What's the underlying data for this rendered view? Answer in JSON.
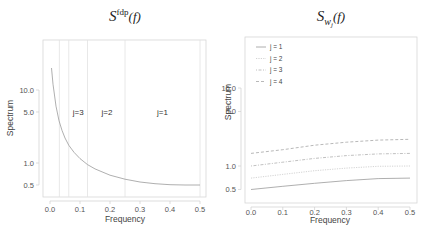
{
  "chart_data": [
    {
      "type": "line",
      "title": "S^fdp(f)",
      "title_main": "S",
      "title_sup": "fdp",
      "title_arg": "(f)",
      "xlabel": "Frequency",
      "ylabel": "Spectrum",
      "xlim": [
        0,
        0.5
      ],
      "ylim_log": [
        0.35,
        40
      ],
      "yscale": "log",
      "xticks": [
        "0.0",
        "0.1",
        "0.2",
        "0.3",
        "0.4",
        "0.5"
      ],
      "yticks": [
        "0.5",
        "1.0",
        "5.0",
        "10.0"
      ],
      "grid": false,
      "vlines": [
        0.03125,
        0.0625,
        0.125,
        0.25,
        0.5
      ],
      "annotations": [
        {
          "text": "j=3",
          "x": 0.094,
          "y": 5.0
        },
        {
          "text": "j=2",
          "x": 0.19,
          "y": 5.0
        },
        {
          "text": "j=1",
          "x": 0.375,
          "y": 5.0
        }
      ],
      "series": [
        {
          "name": "S_fdp",
          "x": [
            0.005,
            0.01,
            0.02,
            0.03,
            0.04,
            0.05,
            0.0625,
            0.08,
            0.1,
            0.125,
            0.15,
            0.2,
            0.25,
            0.3,
            0.35,
            0.4,
            0.45,
            0.5
          ],
          "values": [
            20.0,
            12.0,
            6.0,
            3.8,
            2.8,
            2.2,
            1.75,
            1.4,
            1.15,
            0.95,
            0.83,
            0.68,
            0.6,
            0.55,
            0.52,
            0.505,
            0.5,
            0.5
          ]
        }
      ]
    },
    {
      "type": "line",
      "title": "S_{w_j}(f)",
      "title_main": "S",
      "title_sub": "w",
      "title_subsub": "j",
      "title_arg": "(f)",
      "xlabel": "Frequency",
      "ylabel": "Spectrum",
      "xlim": [
        0,
        0.5
      ],
      "yscale": "log",
      "xticks": [
        "0.0",
        "0.1",
        "0.2",
        "0.3",
        "0.4",
        "0.5"
      ],
      "yticks": [
        "0.5",
        "1.0",
        "5.0",
        "10.0"
      ],
      "grid": false,
      "legend_position": "upper left",
      "legend": [
        "j = 1",
        "j = 2",
        "j = 3",
        "j = 4"
      ],
      "x": [
        0.0,
        0.1,
        0.2,
        0.3,
        0.4,
        0.5
      ],
      "series": [
        {
          "name": "j = 1",
          "style": "solid",
          "values": [
            0.5,
            0.55,
            0.6,
            0.65,
            0.69,
            0.7
          ]
        },
        {
          "name": "j = 2",
          "style": "dotted",
          "values": [
            0.7,
            0.78,
            0.87,
            0.94,
            0.99,
            1.0
          ]
        },
        {
          "name": "j = 3",
          "style": "dotdash",
          "values": [
            1.0,
            1.12,
            1.25,
            1.36,
            1.43,
            1.45
          ]
        },
        {
          "name": "j = 4",
          "style": "dashed",
          "values": [
            1.45,
            1.62,
            1.85,
            2.02,
            2.15,
            2.2
          ]
        }
      ]
    }
  ]
}
